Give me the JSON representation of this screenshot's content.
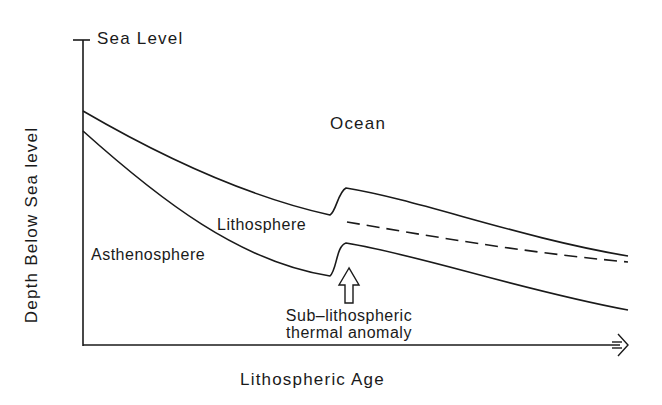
{
  "figure": {
    "axes": {
      "y_label": "Depth Below Sea level",
      "y_top_marker": "Sea Level",
      "x_label": "Lithospheric Age"
    },
    "regions": {
      "ocean": "Ocean",
      "lithosphere": "Lithosphere",
      "asthenosphere": "Asthenosphere"
    },
    "annotation": {
      "line1": "Sub–lithospheric",
      "line2": "thermal anomaly"
    },
    "curves": [
      {
        "name": "seafloor-depth",
        "style": "solid",
        "description": "Top of lithosphere; deepens with age, uplifted by thermal anomaly"
      },
      {
        "name": "lithosphere-base",
        "style": "solid",
        "description": "Base of lithosphere; thickens with age, thinned by thermal anomaly"
      },
      {
        "name": "normal-seafloor-depth",
        "style": "dashed",
        "description": "Expected seafloor depth without anomaly"
      }
    ],
    "colors": {
      "line": "#1a1a1a",
      "background": "#ffffff"
    }
  }
}
